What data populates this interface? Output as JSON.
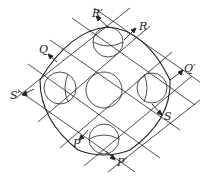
{
  "diagram": {
    "stroke_color": "#222222",
    "labels": [
      {
        "id": "R_prime",
        "text": "R′",
        "x": 92,
        "y": 12
      },
      {
        "id": "R",
        "text": "R",
        "x": 139,
        "y": 25
      },
      {
        "id": "Q",
        "text": "Q",
        "x": 39,
        "y": 48
      },
      {
        "id": "Q_prime",
        "text": "Q′",
        "x": 186,
        "y": 67
      },
      {
        "id": "S_prime",
        "text": "S′",
        "x": 10,
        "y": 94
      },
      {
        "id": "S",
        "text": "S",
        "x": 164,
        "y": 115
      },
      {
        "id": "P",
        "text": "P",
        "x": 73,
        "y": 142
      },
      {
        "id": "P_prime",
        "text": "P′",
        "x": 117,
        "y": 161
      }
    ],
    "circles": [
      {
        "id": "center",
        "cx": 104,
        "cy": 90,
        "r": 18
      },
      {
        "id": "top",
        "cx": 108,
        "cy": 42,
        "r": 15
      },
      {
        "id": "bottom",
        "cx": 104,
        "cy": 139,
        "r": 15
      },
      {
        "id": "left",
        "cx": 60,
        "cy": 88,
        "r": 16
      },
      {
        "id": "right",
        "cx": 152,
        "cy": 88,
        "r": 15
      }
    ]
  }
}
